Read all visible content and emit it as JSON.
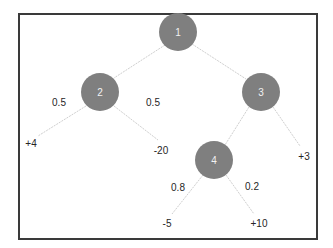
{
  "diagram": {
    "type": "tree",
    "colors": {
      "node_fill": "#7f7f7f",
      "node_text": "#f2f2f2",
      "edge": "#cfcfcf",
      "frame": "#3a3a3a",
      "label_text": "#262626"
    },
    "nodes": [
      {
        "id": "1",
        "label": "1",
        "cx": 178,
        "cy": 32
      },
      {
        "id": "2",
        "label": "2",
        "cx": 100,
        "cy": 92
      },
      {
        "id": "3",
        "label": "3",
        "cx": 261,
        "cy": 92
      },
      {
        "id": "4",
        "label": "4",
        "cx": 214,
        "cy": 160
      }
    ],
    "leaves": [
      {
        "id": "leaf-plus4",
        "label": "+4",
        "x": 31,
        "y": 143
      },
      {
        "id": "leaf-minus20",
        "label": "-20",
        "x": 161,
        "y": 150
      },
      {
        "id": "leaf-plus3",
        "label": "+3",
        "x": 304,
        "y": 156
      },
      {
        "id": "leaf-minus5",
        "label": "-5",
        "x": 167,
        "y": 223
      },
      {
        "id": "leaf-plus10",
        "label": "+10",
        "x": 259,
        "y": 223
      }
    ],
    "edges": [
      {
        "from": "1",
        "to": "2",
        "label": ""
      },
      {
        "from": "1",
        "to": "3",
        "label": ""
      },
      {
        "from": "2",
        "to": "leaf-plus4",
        "label": "0.5"
      },
      {
        "from": "2",
        "to": "leaf-minus20",
        "label": "0.5"
      },
      {
        "from": "3",
        "to": "4",
        "label": ""
      },
      {
        "from": "3",
        "to": "leaf-plus3",
        "label": ""
      },
      {
        "from": "4",
        "to": "leaf-minus5",
        "label": "0.8"
      },
      {
        "from": "4",
        "to": "leaf-plus10",
        "label": "0.2"
      }
    ],
    "edge_labels": [
      {
        "text": "0.5",
        "x": 59,
        "y": 102
      },
      {
        "text": "0.5",
        "x": 153,
        "y": 102
      },
      {
        "text": "0.8",
        "x": 178,
        "y": 187
      },
      {
        "text": "0.2",
        "x": 252,
        "y": 186
      }
    ]
  }
}
